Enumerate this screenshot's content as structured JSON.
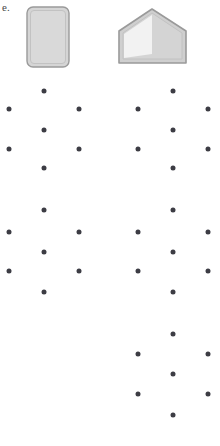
{
  "panel": {
    "label": "e.",
    "width": 220,
    "height": 446,
    "background_color": "#ffffff"
  },
  "shapes": [
    {
      "name": "rounded-rectangle",
      "kind": "rounded-rect",
      "x": 26,
      "y": 6,
      "width": 42,
      "height": 60,
      "corner_radius": 6,
      "fill_color": "#d5d5d5",
      "stroke_color": "#9a9a9a",
      "inner_stroke_color": "#bdbdbd"
    },
    {
      "name": "house-pentagon",
      "kind": "pentagon",
      "x": 115,
      "y": 7,
      "width": 76,
      "height": 58,
      "fill_color": "#cfcfcf",
      "stroke_color": "#9a9a9a",
      "inner_stroke_color": "#bdbdbd",
      "wedge_fill_color": "#f2f2f2",
      "wedge_label": "left-triangular-wedge"
    }
  ],
  "dot_field": {
    "dot_color": "#3c3c44",
    "dot_diameter": 5,
    "cluster_label": "hexagonal-six-dot-lattice-cluster",
    "clusters": [
      {
        "name": "cluster-upper-left",
        "dots": [
          {
            "x": 44,
            "y": 91
          },
          {
            "x": 9,
            "y": 109
          },
          {
            "x": 79,
            "y": 109
          },
          {
            "x": 44,
            "y": 130
          },
          {
            "x": 9,
            "y": 149
          },
          {
            "x": 79,
            "y": 149
          },
          {
            "x": 44,
            "y": 168
          }
        ]
      },
      {
        "name": "cluster-upper-right",
        "dots": [
          {
            "x": 173,
            "y": 91
          },
          {
            "x": 138,
            "y": 109
          },
          {
            "x": 208,
            "y": 109
          },
          {
            "x": 173,
            "y": 130
          },
          {
            "x": 138,
            "y": 149
          },
          {
            "x": 208,
            "y": 149
          },
          {
            "x": 173,
            "y": 168
          }
        ]
      },
      {
        "name": "cluster-lower-left",
        "dots": [
          {
            "x": 44,
            "y": 210
          },
          {
            "x": 9,
            "y": 232
          },
          {
            "x": 79,
            "y": 232
          },
          {
            "x": 44,
            "y": 252
          },
          {
            "x": 9,
            "y": 271
          },
          {
            "x": 79,
            "y": 271
          },
          {
            "x": 44,
            "y": 292
          }
        ]
      },
      {
        "name": "cluster-lower-right",
        "dots": [
          {
            "x": 173,
            "y": 210
          },
          {
            "x": 138,
            "y": 232
          },
          {
            "x": 208,
            "y": 232
          },
          {
            "x": 173,
            "y": 252
          },
          {
            "x": 138,
            "y": 271
          },
          {
            "x": 208,
            "y": 271
          },
          {
            "x": 173,
            "y": 292
          }
        ]
      },
      {
        "name": "cluster-bottom-right",
        "dots": [
          {
            "x": 173,
            "y": 334
          },
          {
            "x": 138,
            "y": 354
          },
          {
            "x": 208,
            "y": 354
          },
          {
            "x": 173,
            "y": 374
          },
          {
            "x": 138,
            "y": 394
          },
          {
            "x": 208,
            "y": 394
          },
          {
            "x": 173,
            "y": 415
          }
        ]
      }
    ]
  }
}
